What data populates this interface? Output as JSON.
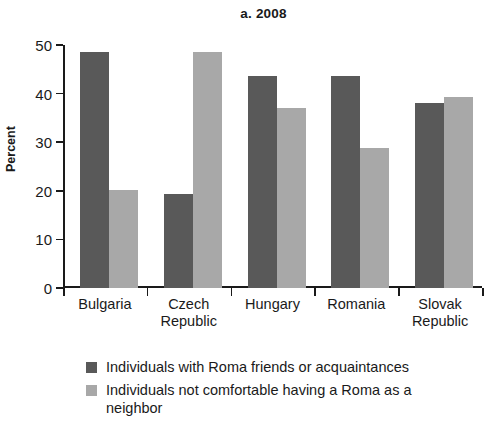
{
  "chart_data": {
    "type": "bar",
    "title": "a. 2008",
    "xlabel": "",
    "ylabel": "Percent",
    "ylim": [
      0,
      50
    ],
    "yticks": [
      0,
      10,
      20,
      30,
      40,
      50
    ],
    "grid": false,
    "legend_position": "bottom",
    "categories": [
      "Bulgaria",
      "Czech Republic",
      "Hungary",
      "Romania",
      "Slovak Republic"
    ],
    "category_lines": [
      [
        "Bulgaria"
      ],
      [
        "Czech",
        "Republic"
      ],
      [
        "Hungary"
      ],
      [
        "Romania"
      ],
      [
        "Slovak",
        "Republic"
      ]
    ],
    "series": [
      {
        "name": "Individuals with Roma friends or acquaintances",
        "color": "#595959",
        "values": [
          48.6,
          19.3,
          43.6,
          43.6,
          38.0
        ]
      },
      {
        "name": "Individuals not comfortable having a Roma as a neighbor",
        "color": "#a8a8a8",
        "values": [
          20.2,
          48.6,
          37.0,
          28.8,
          39.3
        ]
      }
    ]
  }
}
